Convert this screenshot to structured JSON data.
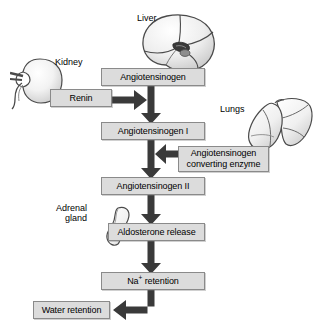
{
  "diagram": {
    "background_color": "#ffffff",
    "box_fill_color": "#dcdcdc",
    "box_border_color": "#8a8a8a",
    "arrow_color": "#3a3a3a",
    "organ_fill_color": "#efefef",
    "organ_outline_color": "#4a4a4a"
  },
  "organs": [
    {
      "id": "kidney",
      "label": "Kidney"
    },
    {
      "id": "liver",
      "label": "Liver"
    },
    {
      "id": "lungs",
      "label": "Lungs"
    },
    {
      "id": "adrenal_gland",
      "label_line1": "Adrenal",
      "label_line2": "gland"
    }
  ],
  "steps": [
    {
      "id": "angiotensinogen",
      "label": "Angiotensinogen"
    },
    {
      "id": "angiotensinogen_i",
      "label": "Angiotensinogen I"
    },
    {
      "id": "angiotensinogen_ii",
      "label": "Angiotensinogen II"
    },
    {
      "id": "aldosterone_release",
      "label": "Aldosterone release"
    },
    {
      "id": "na_retention",
      "label_prefix": "Na",
      "label_sup": "+",
      "label_suffix": " retention"
    },
    {
      "id": "water_retention",
      "label": "Water retention"
    }
  ],
  "inputs": [
    {
      "id": "renin",
      "label": "Renin"
    },
    {
      "id": "converting_enzyme",
      "label_line1": "Angiotensinogen",
      "label_line2": "converting enzyme"
    }
  ]
}
